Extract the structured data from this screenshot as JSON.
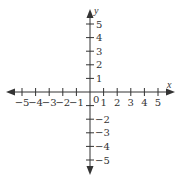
{
  "diagram": {
    "type": "coordinate-plane",
    "origin_label": "0",
    "x_axis": {
      "label": "x",
      "ticks": [
        -5,
        -4,
        -3,
        -2,
        -1,
        1,
        2,
        3,
        4,
        5
      ],
      "tick_labels": [
        "−5",
        "−4",
        "−3",
        "−2",
        "−1",
        "1",
        "2",
        "3",
        "4",
        "5"
      ]
    },
    "y_axis": {
      "label": "y",
      "ticks": [
        -5,
        -4,
        -3,
        -2,
        -1,
        1,
        2,
        3,
        4,
        5
      ],
      "tick_labels": [
        "−5",
        "−4",
        "−3",
        "−2",
        "",
        "1",
        "2",
        "3",
        "4",
        "5"
      ]
    },
    "colors": {
      "axis": "#333333",
      "background": "#ffffff"
    }
  }
}
